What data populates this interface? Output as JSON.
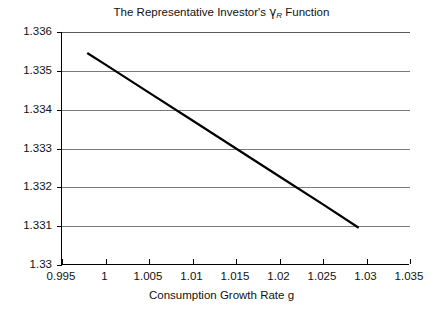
{
  "chart_data": {
    "type": "line",
    "title": "The Representative Investor's γR Function",
    "title_parts": {
      "before": "The Representative Investor's ",
      "gamma": "γ",
      "subscript": "R",
      "after": " Function"
    },
    "xlabel": "Consumption Growth Rate g",
    "ylabel": "",
    "xlim": [
      0.995,
      1.035
    ],
    "ylim": [
      1.33,
      1.336
    ],
    "xticks": [
      0.995,
      1,
      1.005,
      1.01,
      1.015,
      1.02,
      1.025,
      1.03,
      1.035
    ],
    "xtick_labels": [
      "0.995",
      "1",
      "1.005",
      "1.01",
      "1.015",
      "1.02",
      "1.025",
      "1.03",
      "1.035"
    ],
    "yticks": [
      1.33,
      1.331,
      1.332,
      1.333,
      1.334,
      1.335,
      1.336
    ],
    "ytick_labels": [
      "1.33",
      "1.331",
      "1.332",
      "1.333",
      "1.334",
      "1.335",
      "1.336"
    ],
    "grid": "horizontal",
    "grid_color": "#7a7a7a",
    "legend": null,
    "series": [
      {
        "name": "gamma_R",
        "color": "#000000",
        "line_width": 2.2,
        "x": [
          0.9979,
          1.0291
        ],
        "y": [
          1.33546,
          1.33096
        ],
        "points": [
          {
            "x": 0.9979,
            "y": 1.33546
          },
          {
            "x": 1.0,
            "y": 1.33516
          },
          {
            "x": 1.005,
            "y": 1.33444
          },
          {
            "x": 1.01,
            "y": 1.33372
          },
          {
            "x": 1.015,
            "y": 1.333
          },
          {
            "x": 1.02,
            "y": 1.33228
          },
          {
            "x": 1.025,
            "y": 1.33156
          },
          {
            "x": 1.0291,
            "y": 1.33096
          }
        ]
      }
    ]
  }
}
